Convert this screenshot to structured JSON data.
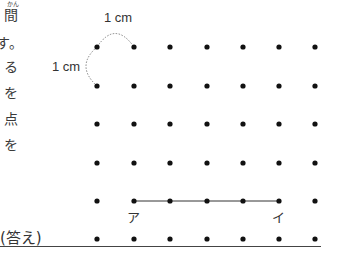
{
  "side_text": {
    "furigana": "かん",
    "chars": [
      "間",
      "す。",
      "る",
      "を",
      "点",
      "を"
    ]
  },
  "grid": {
    "columns": 7,
    "rows": 6,
    "spacing_label_horizontal": "1 cm",
    "spacing_label_vertical": "1 cm",
    "dot_color": "#111111"
  },
  "segment": {
    "start_label": "ア",
    "end_label": "イ",
    "row": 5,
    "start_col": 2,
    "end_col": 6,
    "color": "#333333"
  },
  "answer": {
    "label": "(答え)"
  }
}
